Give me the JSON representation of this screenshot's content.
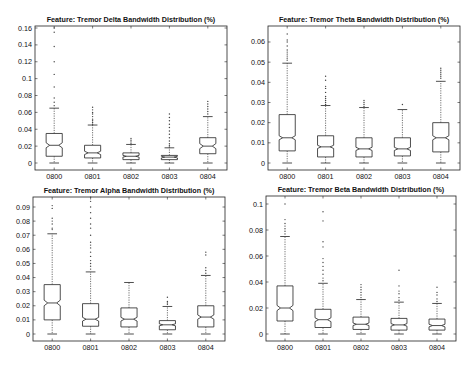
{
  "chart_data": [
    {
      "type": "boxplot",
      "title": "Feature: Tremor Delta Bandwidth Distribution (%)",
      "xlabel": "",
      "ylabel": "",
      "categories": [
        "0800",
        "0801",
        "0802",
        "0803",
        "0804"
      ],
      "ylim": [
        -0.008,
        0.162
      ],
      "yticks": [
        0,
        0.02,
        0.04,
        0.06,
        0.08,
        0.1,
        0.12,
        0.14,
        0.16
      ],
      "ytick_labels": [
        "0",
        "0.02",
        "0.04",
        "0.06",
        "0.08",
        "0.1",
        "0.12",
        "0.14",
        "0.16"
      ],
      "notched": true,
      "box": {
        "x0": 35,
        "y0": 26,
        "x1": 227,
        "y1": 170,
        "ypx_zero": 163,
        "ypx_per_unit": 843.75
      },
      "series": [
        {
          "name": "0800",
          "whisker_low": 0.0,
          "q1": 0.008,
          "median": 0.021,
          "q3": 0.035,
          "whisker_high": 0.065,
          "notch_low": 0.018,
          "notch_high": 0.024,
          "outliers": [
            0.068,
            0.072,
            0.077,
            0.09,
            0.105,
            0.12,
            0.138,
            0.155,
            0.16
          ]
        },
        {
          "name": "0801",
          "whisker_low": 0.0,
          "q1": 0.006,
          "median": 0.012,
          "q3": 0.021,
          "whisker_high": 0.045,
          "notch_low": 0.01,
          "notch_high": 0.014,
          "outliers": [
            0.046,
            0.048,
            0.05,
            0.052,
            0.055,
            0.058,
            0.06,
            0.063,
            0.066
          ]
        },
        {
          "name": "0802",
          "whisker_low": 0.0,
          "q1": 0.004,
          "median": 0.008,
          "q3": 0.012,
          "whisker_high": 0.022,
          "notch_low": 0.007,
          "notch_high": 0.009,
          "outliers": [
            0.023,
            0.025,
            0.027,
            0.029
          ]
        },
        {
          "name": "0803",
          "whisker_low": 0.0,
          "q1": 0.004,
          "median": 0.007,
          "q3": 0.009,
          "whisker_high": 0.018,
          "notch_low": 0.006,
          "notch_high": 0.008,
          "outliers": [
            0.019,
            0.021,
            0.023,
            0.026,
            0.03,
            0.034,
            0.038,
            0.042,
            0.046,
            0.05,
            0.054,
            0.058
          ]
        },
        {
          "name": "0804",
          "whisker_low": 0.0,
          "q1": 0.011,
          "median": 0.02,
          "q3": 0.03,
          "whisker_high": 0.055,
          "notch_low": 0.017,
          "notch_high": 0.023,
          "outliers": [
            0.058,
            0.061,
            0.064,
            0.067,
            0.07,
            0.073
          ]
        }
      ]
    },
    {
      "type": "boxplot",
      "title": "Feature: Tremor Theta Bandwidth Distribution (%)",
      "xlabel": "",
      "ylabel": "",
      "categories": [
        "0800",
        "0801",
        "0802",
        "0803",
        "0804"
      ],
      "ylim": [
        -0.0035,
        0.0675
      ],
      "yticks": [
        0,
        0.01,
        0.02,
        0.03,
        0.04,
        0.05,
        0.06
      ],
      "ytick_labels": [
        "0",
        "0.01",
        "0.02",
        "0.03",
        "0.04",
        "0.05",
        "0.06"
      ],
      "notched": true,
      "box": {
        "x0": 268,
        "y0": 26,
        "x1": 460,
        "y1": 170,
        "ypx_zero": 163,
        "ypx_per_unit": 2016.7
      },
      "series": [
        {
          "name": "0800",
          "whisker_low": 0.0,
          "q1": 0.006,
          "median": 0.0125,
          "q3": 0.024,
          "whisker_high": 0.0495,
          "notch_low": 0.0115,
          "notch_high": 0.0135,
          "outliers": [
            0.051,
            0.052,
            0.053,
            0.054,
            0.055,
            0.056,
            0.058,
            0.06,
            0.061,
            0.064
          ]
        },
        {
          "name": "0801",
          "whisker_low": 0.0,
          "q1": 0.003,
          "median": 0.008,
          "q3": 0.0135,
          "whisker_high": 0.0285,
          "notch_low": 0.0072,
          "notch_high": 0.0088,
          "outliers": [
            0.029,
            0.03,
            0.031,
            0.032,
            0.033,
            0.035,
            0.037,
            0.038,
            0.041,
            0.043
          ]
        },
        {
          "name": "0802",
          "whisker_low": 0.0,
          "q1": 0.003,
          "median": 0.007,
          "q3": 0.0125,
          "whisker_high": 0.0275,
          "notch_low": 0.0062,
          "notch_high": 0.0078,
          "outliers": [
            0.028,
            0.029,
            0.03,
            0.031
          ]
        },
        {
          "name": "0803",
          "whisker_low": 0.0,
          "q1": 0.0035,
          "median": 0.007,
          "q3": 0.0125,
          "whisker_high": 0.0265,
          "notch_low": 0.0062,
          "notch_high": 0.0078,
          "outliers": [
            0.029
          ]
        },
        {
          "name": "0804",
          "whisker_low": 0.0,
          "q1": 0.0055,
          "median": 0.0125,
          "q3": 0.02,
          "whisker_high": 0.0405,
          "notch_low": 0.0115,
          "notch_high": 0.0135,
          "outliers": [
            0.042,
            0.043,
            0.044,
            0.045,
            0.046,
            0.047
          ]
        }
      ]
    },
    {
      "type": "boxplot",
      "title": "Feature: Tremor Alpha Bandwidth Distribution (%)",
      "xlabel": "",
      "ylabel": "",
      "categories": [
        "0800",
        "0801",
        "0802",
        "0803",
        "0804"
      ],
      "ylim": [
        -0.005,
        0.097
      ],
      "yticks": [
        0,
        0.01,
        0.02,
        0.03,
        0.04,
        0.05,
        0.06,
        0.07,
        0.08,
        0.09
      ],
      "ytick_labels": [
        "0",
        "0.01",
        "0.02",
        "0.03",
        "0.04",
        "0.05",
        "0.06",
        "0.07",
        "0.08",
        "0.09"
      ],
      "notched": true,
      "box": {
        "x0": 33,
        "y0": 197,
        "x1": 225,
        "y1": 341,
        "ypx_zero": 334,
        "ypx_per_unit": 1411.1
      },
      "series": [
        {
          "name": "0800",
          "whisker_low": 0.0,
          "q1": 0.01,
          "median": 0.022,
          "q3": 0.035,
          "whisker_high": 0.071,
          "notch_low": 0.02,
          "notch_high": 0.024,
          "outliers": [
            0.074,
            0.075,
            0.078,
            0.08,
            0.082,
            0.089,
            0.091
          ]
        },
        {
          "name": "0801",
          "whisker_low": 0.0,
          "q1": 0.0055,
          "median": 0.0105,
          "q3": 0.0215,
          "whisker_high": 0.044,
          "notch_low": 0.0092,
          "notch_high": 0.0118,
          "outliers": [
            0.046,
            0.048,
            0.05,
            0.052,
            0.055,
            0.058,
            0.061,
            0.063,
            0.065,
            0.07,
            0.075,
            0.078,
            0.082,
            0.086,
            0.09,
            0.094,
            0.097
          ]
        },
        {
          "name": "0802",
          "whisker_low": 0.0,
          "q1": 0.005,
          "median": 0.0105,
          "q3": 0.0185,
          "whisker_high": 0.0365,
          "notch_low": 0.0092,
          "notch_high": 0.0118,
          "outliers": []
        },
        {
          "name": "0803",
          "whisker_low": 0.0,
          "q1": 0.003,
          "median": 0.0065,
          "q3": 0.0095,
          "whisker_high": 0.0195,
          "notch_low": 0.0058,
          "notch_high": 0.0072,
          "outliers": [
            0.021,
            0.022,
            0.023,
            0.026
          ]
        },
        {
          "name": "0804",
          "whisker_low": 0.0,
          "q1": 0.005,
          "median": 0.012,
          "q3": 0.02,
          "whisker_high": 0.0415,
          "notch_low": 0.0105,
          "notch_high": 0.0135,
          "outliers": [
            0.043,
            0.045,
            0.047,
            0.056,
            0.058
          ]
        }
      ]
    },
    {
      "type": "boxplot",
      "title": "Feature: Tremor Beta Bandwidth Distribution (%)",
      "xlabel": "",
      "ylabel": "",
      "categories": [
        "0800",
        "0801",
        "0802",
        "0803",
        "0804"
      ],
      "ylim": [
        -0.005,
        0.105
      ],
      "yticks": [
        0,
        0.02,
        0.04,
        0.06,
        0.08,
        0.1
      ],
      "ytick_labels": [
        "0",
        "0.02",
        "0.04",
        "0.06",
        "0.08",
        "0.1"
      ],
      "notched": true,
      "box": {
        "x0": 266,
        "y0": 196,
        "x1": 456,
        "y1": 341,
        "ypx_zero": 334,
        "ypx_per_unit": 1300
      },
      "series": [
        {
          "name": "0800",
          "whisker_low": 0.0,
          "q1": 0.01,
          "median": 0.02,
          "q3": 0.037,
          "whisker_high": 0.075,
          "notch_low": 0.018,
          "notch_high": 0.022,
          "outliers": [
            0.077,
            0.079,
            0.081,
            0.083,
            0.085,
            0.088,
            0.1
          ]
        },
        {
          "name": "0801",
          "whisker_low": 0.0,
          "q1": 0.005,
          "median": 0.011,
          "q3": 0.019,
          "whisker_high": 0.039,
          "notch_low": 0.0095,
          "notch_high": 0.0125,
          "outliers": [
            0.041,
            0.043,
            0.046,
            0.049,
            0.052,
            0.055,
            0.058,
            0.067,
            0.071,
            0.087,
            0.094
          ]
        },
        {
          "name": "0802",
          "whisker_low": 0.0,
          "q1": 0.0035,
          "median": 0.0075,
          "q3": 0.013,
          "whisker_high": 0.0265,
          "notch_low": 0.0065,
          "notch_high": 0.0085,
          "outliers": [
            0.028,
            0.03,
            0.032,
            0.034,
            0.036,
            0.038
          ]
        },
        {
          "name": "0803",
          "whisker_low": 0.0,
          "q1": 0.003,
          "median": 0.007,
          "q3": 0.012,
          "whisker_high": 0.0245,
          "notch_low": 0.006,
          "notch_high": 0.008,
          "outliers": [
            0.026,
            0.028,
            0.031,
            0.033,
            0.037,
            0.049
          ]
        },
        {
          "name": "0804",
          "whisker_low": 0.0,
          "q1": 0.003,
          "median": 0.0065,
          "q3": 0.0115,
          "whisker_high": 0.0235,
          "notch_low": 0.0055,
          "notch_high": 0.0075,
          "outliers": [
            0.025,
            0.027,
            0.03,
            0.032,
            0.036
          ]
        }
      ]
    }
  ]
}
